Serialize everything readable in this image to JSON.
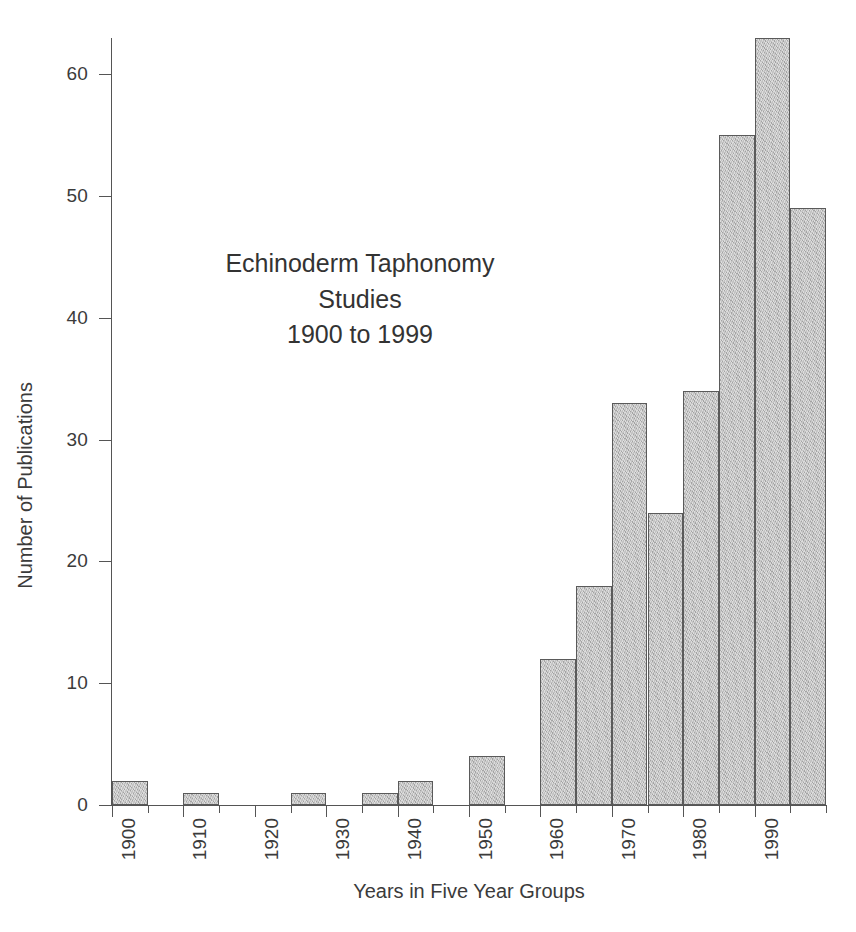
{
  "chart_data": {
    "type": "bar",
    "title": "Echinoderm Taphonomy Studies 1900 to 1999",
    "title_lines": [
      "Echinoderm Taphonomy",
      "Studies",
      "1900 to 1999"
    ],
    "xlabel": "Years in Five Year Groups",
    "ylabel": "Number of Publications",
    "grid": false,
    "legend": "none",
    "ylim": [
      0,
      65
    ],
    "ytick_values": [
      0,
      10,
      20,
      30,
      40,
      50,
      60
    ],
    "ytick_labels": [
      "0",
      "10",
      "20",
      "30",
      "40",
      "50",
      "60"
    ],
    "xlim": [
      1900,
      2000
    ],
    "bin_width_years": 5,
    "xtick_values": [
      1900,
      1905,
      1910,
      1915,
      1920,
      1925,
      1930,
      1935,
      1940,
      1945,
      1950,
      1955,
      1960,
      1965,
      1970,
      1975,
      1980,
      1985,
      1990,
      1995,
      2000
    ],
    "xtick_labels": [
      "1900",
      "",
      "1910",
      "",
      "1920",
      "",
      "1930",
      "",
      "1940",
      "",
      "1950",
      "",
      "1960",
      "",
      "1970",
      "",
      "1980",
      "",
      "1990",
      "",
      ""
    ],
    "categories": [
      "1900",
      "1905",
      "1910",
      "1915",
      "1920",
      "1925",
      "1930",
      "1935",
      "1940",
      "1945",
      "1950",
      "1955",
      "1960",
      "1965",
      "1970",
      "1975",
      "1980",
      "1985",
      "1990",
      "1995"
    ],
    "values": [
      2,
      0,
      1,
      0,
      0,
      1,
      0,
      1,
      2,
      0,
      4,
      0,
      12,
      18,
      33,
      24,
      34,
      55,
      63,
      49
    ],
    "bar_fill_color": "#b9b9b9",
    "bar_edge_color": "#5a5a5a",
    "axis_color": "#555555",
    "text_color": "#3b3b3b",
    "background_color": "#ffffff"
  },
  "caption": {
    "text": ""
  }
}
